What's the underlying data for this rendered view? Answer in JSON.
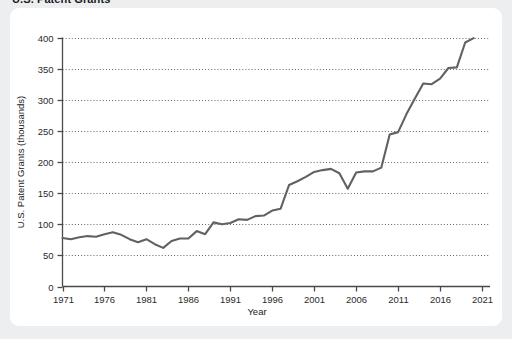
{
  "title": "U.S. Patent Grants",
  "card": {
    "background_color": "#ffffff",
    "page_background_color": "#edeef0"
  },
  "axes": {
    "x_label": "Year",
    "y_label": "U.S. Patent Grants (thousands)",
    "x_ticks": [
      "1971",
      "1976",
      "1981",
      "1986",
      "1991",
      "1996",
      "2001",
      "2006",
      "2011",
      "2016",
      "2021"
    ],
    "y_ticks": [
      "0",
      "50",
      "100",
      "150",
      "200",
      "250",
      "300",
      "350",
      "400"
    ]
  },
  "chart_data": {
    "type": "line",
    "title": "U.S. Patent Grants",
    "xlabel": "Year",
    "ylabel": "U.S. Patent Grants (thousands)",
    "xlim": [
      1971,
      2021
    ],
    "ylim": [
      0,
      400
    ],
    "x_tick_step": 5,
    "y_tick_step": 50,
    "grid": true,
    "grid_style": "dotted-horizontal",
    "legend": "none",
    "line_color": "#616161",
    "series": [
      {
        "name": "U.S. Patent Grants (thousands)",
        "x": [
          1971,
          1972,
          1973,
          1974,
          1975,
          1976,
          1977,
          1978,
          1979,
          1980,
          1981,
          1982,
          1983,
          1984,
          1985,
          1986,
          1987,
          1988,
          1989,
          1990,
          1991,
          1992,
          1993,
          1994,
          1995,
          1996,
          1997,
          1998,
          1999,
          2000,
          2001,
          2002,
          2003,
          2004,
          2005,
          2006,
          2007,
          2008,
          2009,
          2010,
          2011,
          2012,
          2013,
          2014,
          2015,
          2016,
          2017,
          2018,
          2019,
          2020
        ],
        "values": [
          78,
          76,
          79,
          81,
          80,
          84,
          87,
          83,
          76,
          71,
          76,
          68,
          62,
          73,
          77,
          77,
          89,
          84,
          103,
          100,
          102,
          108,
          107,
          113,
          114,
          122,
          125,
          163,
          169,
          176,
          184,
          187,
          189,
          182,
          157,
          183,
          185,
          185,
          191,
          244,
          248,
          277,
          302,
          326,
          325,
          334,
          351,
          352,
          392,
          399
        ]
      }
    ]
  }
}
